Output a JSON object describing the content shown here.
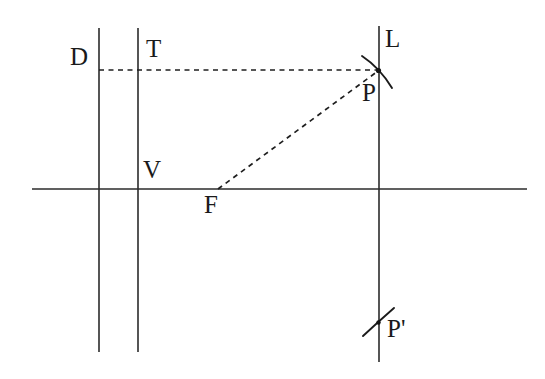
{
  "figure": {
    "background_color": "#ffffff",
    "stroke_color": "#2b2b2b",
    "dash_color": "#1f1f1f",
    "width": 545,
    "height": 379
  },
  "labels": {
    "directrix": "D",
    "tangent_point": "T",
    "line": "L",
    "vertex": "V",
    "focus": "F",
    "point_p": "P",
    "point_p_prime": "P'"
  },
  "geometry": {
    "axis": {
      "name": "horizontal-axis",
      "x1": 32,
      "y1": 189,
      "x2": 527,
      "y2": 189
    },
    "vertical_lines": [
      {
        "name": "directrix-line",
        "x": 99,
        "y1": 28,
        "y2": 352
      },
      {
        "name": "vertex-vertical-line",
        "x": 138,
        "y1": 28,
        "y2": 352
      },
      {
        "name": "line-L",
        "x": 379,
        "y1": 26,
        "y2": 362
      }
    ],
    "dashed_segments": [
      {
        "name": "segment-D-to-P",
        "x1": 99,
        "y1": 70,
        "x2": 379,
        "y2": 70
      },
      {
        "name": "segment-F-to-P",
        "x1": 218,
        "y1": 189,
        "x2": 378,
        "y2": 71
      }
    ],
    "arcs": [
      {
        "name": "arc-at-P",
        "cx": 378,
        "cy": 71,
        "radius": 22
      },
      {
        "name": "tick-at-P-prime",
        "cx": 378,
        "cy": 323,
        "radius": 17
      }
    ],
    "points": [
      {
        "name": "point-P",
        "x": 378,
        "y": 71
      },
      {
        "name": "point-P-prime",
        "x": 378,
        "y": 323
      },
      {
        "name": "point-F",
        "x": 218,
        "y": 189
      },
      {
        "name": "point-V",
        "x": 138,
        "y": 189
      },
      {
        "name": "point-T",
        "x": 138,
        "y": 70
      },
      {
        "name": "point-D",
        "x": 99,
        "y": 70
      }
    ]
  },
  "label_positions": {
    "D": {
      "x": 70,
      "y": 44
    },
    "T": {
      "x": 146,
      "y": 36
    },
    "L": {
      "x": 385,
      "y": 26
    },
    "V": {
      "x": 143,
      "y": 157
    },
    "F": {
      "x": 204,
      "y": 192
    },
    "P": {
      "x": 362,
      "y": 80
    },
    "Pprime": {
      "x": 387,
      "y": 316
    }
  }
}
